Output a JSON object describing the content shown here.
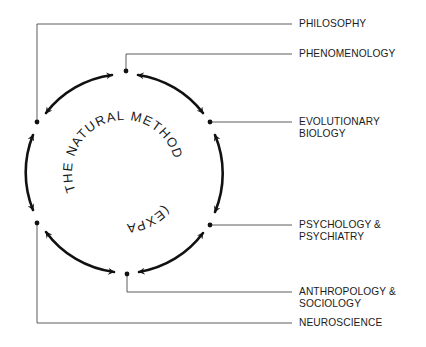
{
  "diagram": {
    "center_title": {
      "text": "THE NATURAL METHOD (EXPANDED)",
      "line1": "THE NATURAL METHOD",
      "line2": "(EXPANDED)"
    },
    "colors": {
      "ink": "#1a1a1a",
      "connector": "#444444",
      "background": "#ffffff"
    },
    "nodes": [
      {
        "id": "top",
        "x": 126,
        "y": 71,
        "label": "PHENOMENOLOGY"
      },
      {
        "id": "upper-right",
        "x": 210,
        "y": 122,
        "label": "EVOLUTIONARY BIOLOGY"
      },
      {
        "id": "lower-right",
        "x": 210,
        "y": 225,
        "label": "PSYCHOLOGY & PSYCHIATRY"
      },
      {
        "id": "bottom",
        "x": 127,
        "y": 274,
        "label": "ANTHROPOLOGY & SOCIOLOGY"
      },
      {
        "id": "lower-left",
        "x": 37,
        "y": 223,
        "label": "NEUROSCIENCE"
      },
      {
        "id": "upper-left",
        "x": 37,
        "y": 122,
        "label": "PHILOSOPHY"
      }
    ],
    "labels": {
      "philosophy": {
        "lines": [
          "PHILOSOPHY"
        ]
      },
      "phenomenology": {
        "lines": [
          "PHENOMENOLOGY"
        ]
      },
      "evolutionary_biology": {
        "lines": [
          "EVOLUTIONARY",
          "BIOLOGY"
        ]
      },
      "psychology_psychiatry": {
        "lines": [
          "PSYCHOLOGY &",
          "PSYCHIATRY"
        ]
      },
      "anthropology_sociology": {
        "lines": [
          "ANTHROPOLOGY &",
          "SOCIOLOGY"
        ]
      },
      "neuroscience": {
        "lines": [
          "NEUROSCIENCE"
        ]
      }
    },
    "edges": [
      {
        "from": "top",
        "to": "upper-right",
        "type": "bidirectional"
      },
      {
        "from": "upper-right",
        "to": "lower-right",
        "type": "bidirectional"
      },
      {
        "from": "lower-right",
        "to": "bottom",
        "type": "bidirectional"
      },
      {
        "from": "bottom",
        "to": "lower-left",
        "type": "bidirectional"
      },
      {
        "from": "lower-left",
        "to": "upper-left",
        "type": "bidirectional"
      },
      {
        "from": "upper-left",
        "to": "top",
        "type": "bidirectional"
      }
    ]
  }
}
